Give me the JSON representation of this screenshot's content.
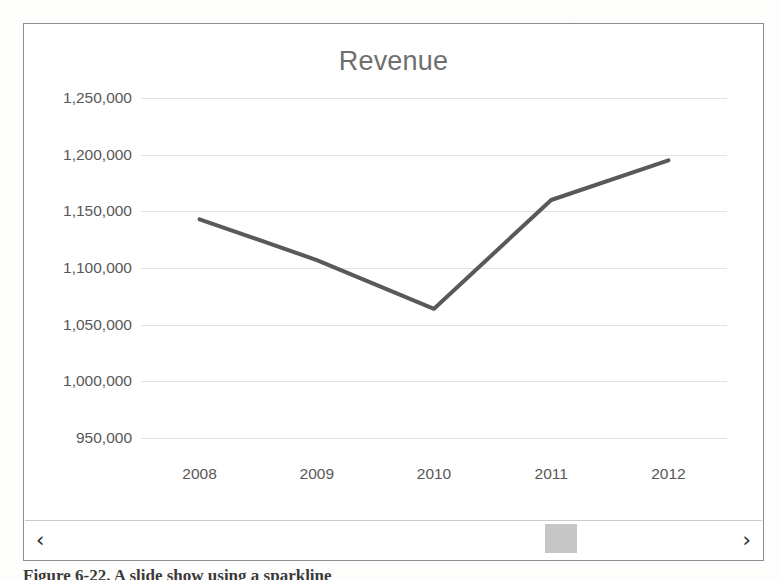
{
  "figure": {
    "caption": "Figure 6-22. A slide show using a sparkline"
  },
  "chart_object": {
    "title": "Revenue",
    "scrollbar": {
      "left_arrow_icon": "chevron-left-icon",
      "right_arrow_icon": "chevron-right-icon",
      "left_arrow_glyph": "‹",
      "right_arrow_glyph": "›",
      "thumb_position_percent": 76
    }
  },
  "chart_data": {
    "type": "line",
    "title": "Revenue",
    "xlabel": "",
    "ylabel": "",
    "categories": [
      "2008",
      "2009",
      "2010",
      "2011",
      "2012"
    ],
    "x": [
      2008,
      2009,
      2010,
      2011,
      2012
    ],
    "values": [
      1143000,
      1107000,
      1064000,
      1160000,
      1195000
    ],
    "series": [
      {
        "name": "Revenue",
        "values": [
          1143000,
          1107000,
          1064000,
          1160000,
          1195000
        ],
        "color": "#595959",
        "line_width": 4,
        "markers": false
      }
    ],
    "ylim": [
      950000,
      1250000
    ],
    "ytick_values": [
      1250000,
      1200000,
      1150000,
      1100000,
      1050000,
      1000000,
      950000
    ],
    "ytick_labels": [
      "1,250,000",
      "1,200,000",
      "1,150,000",
      "1,100,000",
      "1,050,000",
      "1,000,000",
      "950,000"
    ],
    "ytick_step": 50000,
    "xtick_labels": [
      "2008",
      "2009",
      "2010",
      "2011",
      "2012"
    ],
    "grid": true,
    "grid_axis": "y",
    "grid_color": "#e3e3e3",
    "legend": false,
    "legend_position": "none",
    "axis_line": false,
    "title_color": "#6f6f6f",
    "tick_label_color": "#585858"
  }
}
